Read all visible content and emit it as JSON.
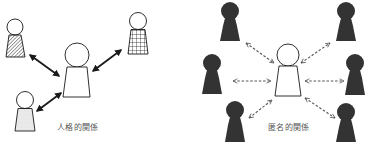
{
  "colors": {
    "stroke": "#1a1a1a",
    "dark_figure": "#333333",
    "label": "#555555",
    "background": "#ffffff"
  },
  "panels": [
    {
      "id": "personal",
      "label": "人格的関係",
      "center_figure": {
        "style": "outline"
      },
      "others": [
        {
          "position": "top-left",
          "style": "diagonal-hatch"
        },
        {
          "position": "top-right",
          "style": "grid"
        },
        {
          "position": "bottom-left",
          "style": "dotted"
        }
      ],
      "connector": "solid bidirectional arrow"
    },
    {
      "id": "anonymous",
      "label": "匿名的関係",
      "center_figure": {
        "style": "outline"
      },
      "others": [
        {
          "position": "top-left",
          "style": "solid-dark"
        },
        {
          "position": "top-right",
          "style": "solid-dark"
        },
        {
          "position": "middle-left",
          "style": "solid-dark"
        },
        {
          "position": "middle-right",
          "style": "solid-dark"
        },
        {
          "position": "bottom-left",
          "style": "solid-dark"
        },
        {
          "position": "bottom-right",
          "style": "solid-dark"
        }
      ],
      "connector": "dashed bidirectional arrow"
    }
  ]
}
